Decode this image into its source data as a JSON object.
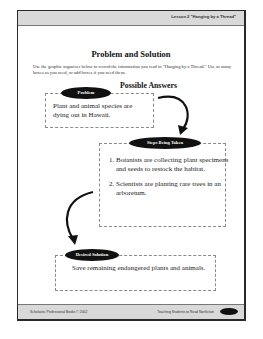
{
  "header": {
    "lesson_label": "Lesson 2 \"Hanging by a Thread\""
  },
  "title": "Problem and Solution",
  "instructions": "Use the graphic organizer below to record the information you read in \"Hanging by a Thread.\" Use as many boxes as you need, or add boxes if you need them.",
  "possible_answers_label": "Possible Answers",
  "problem": {
    "label": "Problem",
    "text": "Plant and animal species are dying out in Hawaii."
  },
  "steps": {
    "label": "Steps Being Taken",
    "items": [
      "Botanists are collecting plant specimens and seeds to restock the habitat.",
      "Scientists are planting rare trees in an arboretum."
    ]
  },
  "solution": {
    "label": "Desired Solution",
    "text": "Save remaining endangered plants and animals."
  },
  "footer": {
    "left": "Scholastic Professional Books © 2002",
    "right": "Teaching Students to Read Nonfiction",
    "page_number": ""
  }
}
